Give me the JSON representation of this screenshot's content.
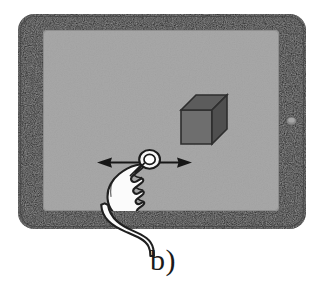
{
  "figure": {
    "caption": "b)",
    "background_color": "#ffffff",
    "subfigure_label": "b)"
  },
  "device": {
    "name": "tablet",
    "bezel_color": "#1c1c1c",
    "bezel_highlight_color": "#3a3a3a",
    "screen_color": "#a8a8a8",
    "screen_edge_color": "#8f8f8f",
    "home_button": {
      "name": "home-button",
      "color": "#9a9a9a",
      "position": "right-bezel"
    }
  },
  "scene": {
    "object": {
      "name": "cube",
      "label": "3D cube",
      "front_face_color": "#6e6e6e",
      "top_face_color": "#5a5a5a",
      "side_face_color": "#4e4e4e",
      "outline_color": "#2b2b2b"
    },
    "gesture": {
      "name": "horizontal-drag",
      "label": "one-finger horizontal drag",
      "arrow": {
        "name": "double-headed-horizontal-arrow",
        "direction": "left-right",
        "color": "#161616"
      },
      "touch_point": {
        "name": "touch-point-indicator",
        "fill_color": "#f7f7f7",
        "outline_color": "#1a1a1a"
      },
      "hand": {
        "name": "pointing-hand",
        "fill_color": "#fbfbfb",
        "outline_color": "#1f1f1f"
      }
    }
  }
}
